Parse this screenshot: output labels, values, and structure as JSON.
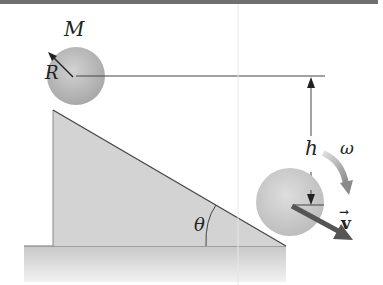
{
  "figure": {
    "labels": {
      "mass": "M",
      "radius": "R",
      "height": "h",
      "angular_velocity": "ω",
      "velocity": "v",
      "velocity_arrow": "→",
      "angle": "θ"
    },
    "colors": {
      "top_bar": "#707070",
      "sphere": "#c4c4c4",
      "wedge": "#d3d3d3",
      "ground": "#cfcfcf",
      "lines": "#444444",
      "omega_arrow": "#9a9a9a",
      "velocity_arrow": "#555555"
    }
  }
}
